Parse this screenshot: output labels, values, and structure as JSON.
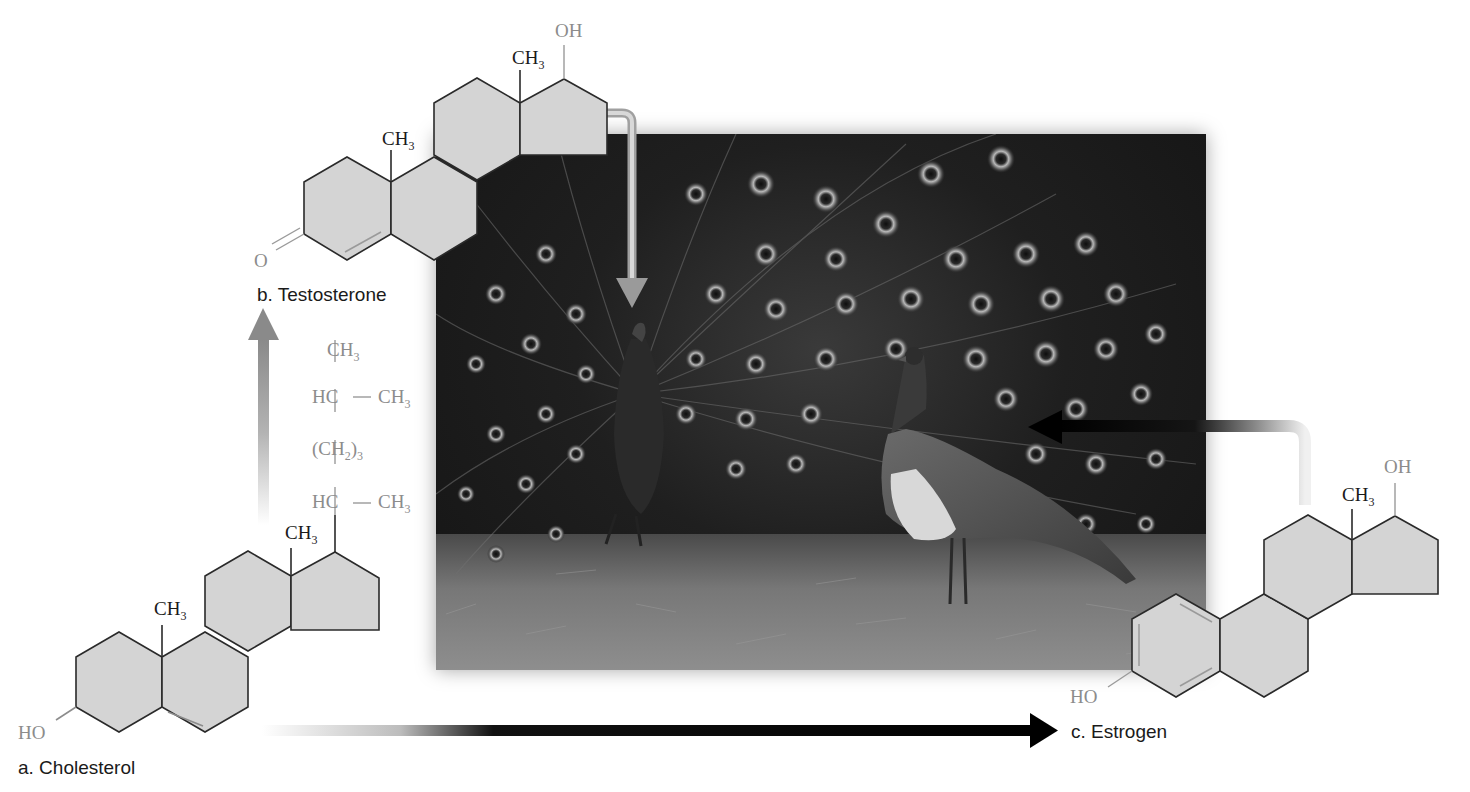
{
  "figure": {
    "labels": {
      "cholesterol": "a. Cholesterol",
      "testosterone": "b. Testosterone",
      "estrogen": "c. Estrogen"
    },
    "cholesterol": {
      "ho": "HO",
      "ch3_a": "CH",
      "ch3_b": "CH",
      "sub3": "3",
      "side_chain": {
        "top": "CH",
        "hc1": "HC",
        "ch3_1": "CH",
        "ch2_3": "(CH",
        "ch2_sub": "2",
        "ch2_close": ")",
        "ch2_mult": "3",
        "hc2": "HC",
        "ch3_2": "CH"
      }
    },
    "testosterone": {
      "o": "O",
      "oh": "OH",
      "ch3_a": "CH",
      "ch3_b": "CH",
      "sub3": "3"
    },
    "estrogen": {
      "ho": "HO",
      "oh": "OH",
      "ch3": "CH",
      "sub3": "3"
    },
    "photo": {
      "subject": "peacock-displaying-to-peahen",
      "description": "Male peacock with fanned tail and peahen on grass"
    },
    "colors": {
      "ring_fill": "#d4d4d4",
      "ring_stroke": "#2a2a2a",
      "heteroatom_gray": "#8c8c8c",
      "arrow_dark": "#111111",
      "arrow_gray": "#8a8a8a"
    }
  }
}
